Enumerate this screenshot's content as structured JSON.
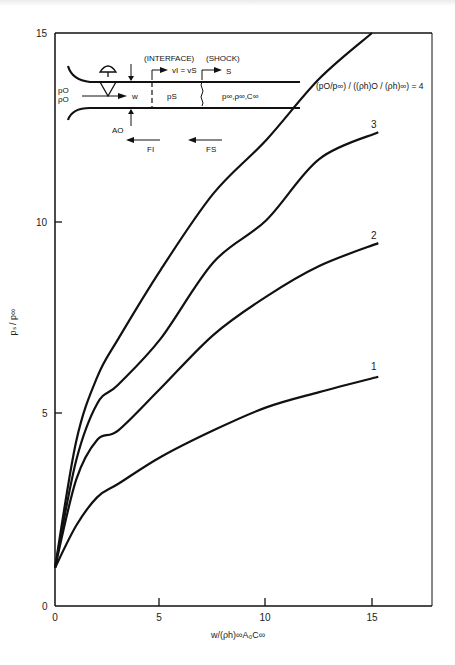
{
  "chart_data": {
    "type": "line",
    "title": "",
    "xlabel": "w/(ρh)∞A₀C∞",
    "ylabel": "pₛ / p∞",
    "xlim": [
      0,
      18
    ],
    "ylim": [
      0,
      15
    ],
    "x_ticks": [
      0,
      5,
      10,
      15
    ],
    "y_ticks": [
      0,
      5,
      10,
      15
    ],
    "grid": false,
    "legend_title": "(p₀/p∞) / ((ρh)₀ / (ρh)∞) = 4",
    "series": [
      {
        "name": "1",
        "x": [
          0,
          1,
          2,
          3,
          5,
          7.5,
          10,
          12.5,
          15.3
        ],
        "values": [
          1.0,
          2.1,
          2.85,
          3.2,
          3.9,
          4.6,
          5.2,
          5.6,
          6.0
        ]
      },
      {
        "name": "2",
        "x": [
          0,
          1,
          2,
          3,
          5,
          7.5,
          10,
          12.5,
          15.3
        ],
        "values": [
          1.0,
          3.3,
          4.35,
          4.6,
          5.7,
          7.1,
          8.1,
          8.9,
          9.5
        ]
      },
      {
        "name": "3",
        "x": [
          0,
          1,
          2,
          3,
          5,
          7.5,
          10,
          12.5,
          15.3
        ],
        "values": [
          1.0,
          3.8,
          5.3,
          5.8,
          7.0,
          9.0,
          10.1,
          11.7,
          12.4
        ]
      },
      {
        "name": "4",
        "x": [
          0,
          1,
          2,
          3,
          5,
          7.5,
          10,
          12.5,
          15.0
        ],
        "values": [
          1.0,
          4.3,
          6.0,
          7.0,
          8.8,
          10.8,
          12.2,
          13.8,
          15.0
        ]
      }
    ],
    "curve_labels": [
      "1",
      "2",
      "3"
    ],
    "annotations": [
      "(INTERFACE)",
      "(SHOCK)",
      "vᵢ = vₛ",
      "S",
      "p₀",
      "ρ₀",
      "w",
      "pₛ",
      "p∞,ρ∞,C∞",
      "A₀",
      "Fᵢ",
      "Fₛ"
    ]
  },
  "axes": {
    "x_tick_labels": [
      "0",
      "5",
      "10",
      "15"
    ],
    "y_tick_labels": [
      "0",
      "5",
      "10",
      "15"
    ],
    "xlabel": "w/(ρh)∞A₀C∞",
    "ylabel": "pₛ / p∞"
  },
  "inset": {
    "interface": "(INTERFACE)",
    "shock": "(SHOCK)",
    "velocity": "vI = vS",
    "s_label": "S",
    "p0": "pO",
    "rho0": "ρO",
    "w": "w",
    "ps": "pS",
    "ambient": "p∞,ρ∞,C∞",
    "a0": "AO",
    "fi": "FI",
    "fs": "FS"
  },
  "legend": {
    "text": "(pO/p∞) / ((ρh)O / (ρh)∞) = 4"
  },
  "labels": {
    "c1": "1",
    "c2": "2",
    "c3": "3"
  }
}
